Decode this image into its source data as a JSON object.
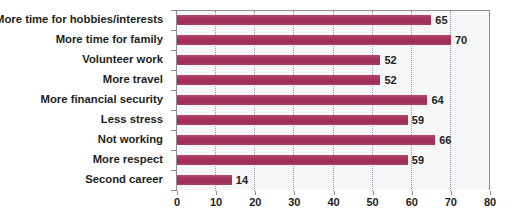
{
  "chart_data": {
    "type": "bar",
    "orientation": "horizontal",
    "title": "",
    "subtitle": "",
    "xlabel": "",
    "ylabel": "",
    "xlim": [
      0,
      80
    ],
    "xticks": [
      0,
      10,
      20,
      30,
      40,
      50,
      60,
      70,
      80
    ],
    "xtick_labels": [
      "0",
      "10",
      "20",
      "30",
      "40",
      "50",
      "60",
      "70",
      "80"
    ],
    "grid": true,
    "grid_axis": "x",
    "grid_style": "dotted",
    "legend": false,
    "legend_position": "none",
    "bar_color": "#a9365f",
    "plot_background": "#f7f6f8",
    "categories": [
      "More time for hobbies/interests",
      "More time for family",
      "Volunteer work",
      "More travel",
      "More financial security",
      "Less stress",
      "Not working",
      "More respect",
      "Second career"
    ],
    "values": [
      65,
      70,
      52,
      52,
      64,
      59,
      66,
      59,
      14
    ],
    "value_labels": [
      "65",
      "70",
      "52",
      "52",
      "64",
      "59",
      "66",
      "59",
      "14"
    ]
  }
}
